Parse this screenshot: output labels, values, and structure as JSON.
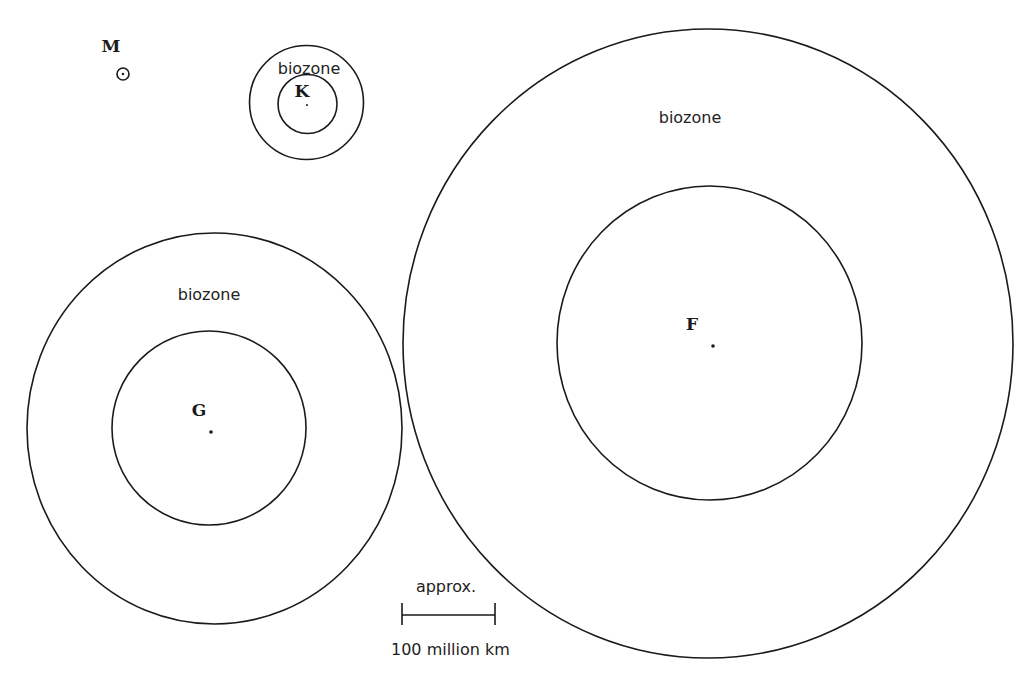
{
  "stars": [
    {
      "id": "M",
      "label": "M",
      "has_biozone": false,
      "zone_label": ""
    },
    {
      "id": "K",
      "label": "K",
      "has_biozone": true,
      "zone_label": "biozone"
    },
    {
      "id": "G",
      "label": "G",
      "has_biozone": true,
      "zone_label": "biozone"
    },
    {
      "id": "F",
      "label": "F",
      "has_biozone": true,
      "zone_label": "biozone"
    }
  ],
  "scale_bar": {
    "top_label": "approx.",
    "bottom_label": "100 million km",
    "represents_km": 100000000
  },
  "colors": {
    "stroke": "#1a1a1a",
    "background": "#ffffff",
    "text": "#222222"
  }
}
